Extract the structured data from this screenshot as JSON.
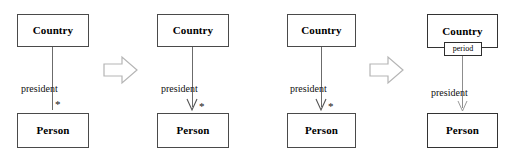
{
  "diagram": {
    "panel_count": 4,
    "colors": {
      "background": "#ffffff",
      "box_border": "#4a4a4a",
      "box_border_strong": "#333333",
      "line": "#6b6b6b",
      "line_light": "#8d8d8d",
      "text": "#000000",
      "step_arrow": "#b0b0b0"
    },
    "panels": [
      {
        "id": "panel-1",
        "source_class": "Country",
        "target_class": "Person",
        "role_label": "president",
        "multiplicity": "*",
        "has_arrowhead": false,
        "association_class": null
      },
      {
        "id": "panel-2",
        "source_class": "Country",
        "target_class": "Person",
        "role_label": "president",
        "multiplicity": "*",
        "has_arrowhead": true,
        "association_class": null
      },
      {
        "id": "panel-3",
        "source_class": "Country",
        "target_class": "Person",
        "role_label": "president",
        "multiplicity": "*",
        "has_arrowhead": true,
        "association_class": null
      },
      {
        "id": "panel-4",
        "source_class": "Country",
        "target_class": "Person",
        "role_label": "president",
        "multiplicity": "",
        "has_arrowhead": true,
        "association_class": "period"
      }
    ],
    "step_arrows": [
      {
        "id": "step-arrow-1",
        "direction": "right",
        "between": "panel-1 → panel-2"
      },
      {
        "id": "step-arrow-2",
        "direction": "right",
        "between": "panel-3 → panel-4"
      }
    ]
  }
}
